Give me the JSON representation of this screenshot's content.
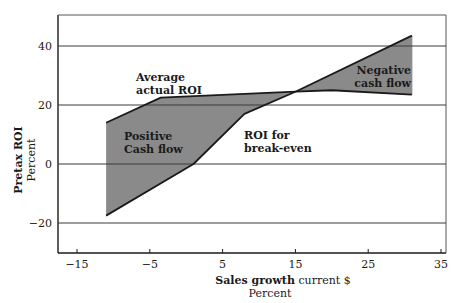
{
  "chart_data": {
    "type": "area",
    "title": "",
    "xlabel": "Sales growth current $",
    "xlabel_bold": "Sales growth",
    "xlabel_rest": " current $",
    "xlabel_unit": "Percent",
    "ylabel": "Pretax ROI",
    "ylabel_unit": "Percent",
    "xlim": [
      -17.5,
      35.5
    ],
    "ylim": [
      -30,
      50
    ],
    "x_ticks": [
      -15,
      -5,
      5,
      15,
      25,
      35
    ],
    "y_ticks": [
      40,
      20,
      0,
      -20
    ],
    "grid": "horizontal",
    "series": [
      {
        "name": "Average actual ROI",
        "x": [
          -11,
          -3.5,
          15,
          20,
          31
        ],
        "y": [
          14,
          22.5,
          24.5,
          25,
          23.5
        ]
      },
      {
        "name": "ROI for break-even",
        "x": [
          -11,
          1,
          8,
          15,
          31
        ],
        "y": [
          -17.5,
          0,
          17,
          24.5,
          43.5
        ]
      }
    ],
    "annotations": [
      {
        "text_lines": [
          "Average",
          "actual ROI"
        ],
        "x": -6,
        "y": 28
      },
      {
        "text_lines": [
          "Positive",
          "Cash flow"
        ],
        "x": -10,
        "y": 7
      },
      {
        "text_lines": [
          "ROI for",
          "break-even"
        ],
        "x": 9,
        "y": 7
      },
      {
        "text_lines": [
          "Negative",
          "cash flow"
        ],
        "x": 25,
        "y": 29
      }
    ],
    "fill_regions": [
      {
        "name": "Positive Cash flow",
        "x_range": [
          -11,
          15
        ]
      },
      {
        "name": "Negative cash flow",
        "x_range": [
          15,
          31
        ]
      }
    ],
    "colors": {
      "fill": "#8a8a8a",
      "line": "#1a1a1a",
      "grid": "#3a3a3a",
      "frame": "#555555"
    }
  }
}
